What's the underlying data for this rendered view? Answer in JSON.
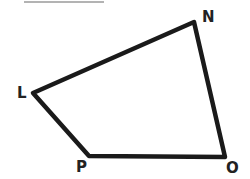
{
  "diagram": {
    "type": "quadrilateral",
    "stroke_color": "#1a1a1a",
    "top_rule_color": "#9a9a9a",
    "vertices": [
      {
        "name": "N",
        "x": 194,
        "y": 22,
        "label_x": 202,
        "label_y": 22
      },
      {
        "name": "O",
        "x": 225,
        "y": 157,
        "label_x": 226,
        "label_y": 173
      },
      {
        "name": "P",
        "x": 89,
        "y": 156,
        "label_x": 76,
        "label_y": 172
      },
      {
        "name": "L",
        "x": 33,
        "y": 93,
        "label_x": 17,
        "label_y": 98
      }
    ]
  }
}
